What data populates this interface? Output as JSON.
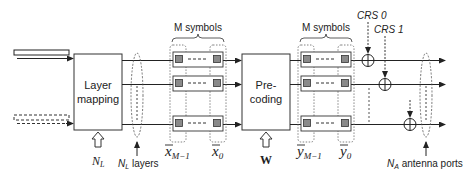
{
  "diagram": {
    "blocks": {
      "layer_mapping": {
        "line1": "Layer",
        "line2": "mapping"
      },
      "precoding": {
        "line1": "Pre-",
        "line2": "coding"
      }
    },
    "labels": {
      "m_symbols_x": "M symbols",
      "m_symbols_y": "M symbols",
      "crs0": "CRS 0",
      "crs1": "CRS 1",
      "nl_input": "N",
      "nl_input_sub": "L",
      "nl_layers_n": "N",
      "nl_layers_sub": "L",
      "nl_layers_text": " layers",
      "w_matrix": "W",
      "x_last": "x",
      "x_last_sub": "M−1",
      "x_first": "x",
      "x_first_sub": "0",
      "y_last": "y",
      "y_last_sub": "M−1",
      "y_first": "y",
      "y_first_sub": "0",
      "na_n": "N",
      "na_sub": "A",
      "na_text": " antenna ports"
    },
    "colors": {
      "line": "#222222",
      "symbol_fill": "#8a8a8a",
      "dotted": "#555555"
    }
  }
}
